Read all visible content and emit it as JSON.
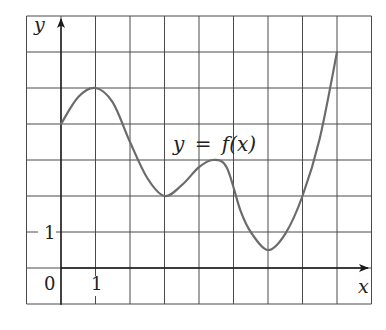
{
  "chart_data": {
    "type": "line",
    "title": "",
    "xlabel": "x",
    "ylabel": "y",
    "curve_label": "y = f(x)",
    "curve_label_parts": {
      "y": "y",
      "eq": "=",
      "f": "f",
      "arg": "(x)"
    },
    "origin_label": "0",
    "x_tick_labels": [
      {
        "value": 1,
        "label": "1"
      }
    ],
    "y_tick_labels": [
      {
        "value": 1,
        "label": "1"
      }
    ],
    "xlim": [
      -1,
      9
    ],
    "ylim": [
      -1,
      7
    ],
    "grid": true,
    "grid_step": 1,
    "legend": null,
    "series": [
      {
        "name": "f(x)",
        "color": "#6b6b6b",
        "x": [
          0,
          0.5,
          1,
          1.5,
          2,
          2.5,
          3,
          3.5,
          4,
          4.4,
          4.8,
          5.2,
          5.5,
          6,
          6.5,
          7,
          7.5,
          8
        ],
        "y": [
          4,
          4.75,
          5,
          4.6,
          3.5,
          2.5,
          2,
          2.3,
          2.8,
          3,
          2.8,
          1.6,
          1,
          0.5,
          0.95,
          2,
          3.6,
          6
        ]
      }
    ]
  }
}
